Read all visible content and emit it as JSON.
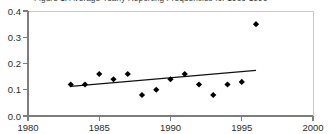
{
  "chart_data": {
    "type": "scatter",
    "title": "Figure 1: Average Yearly Reporting Frequencies for 1983-1996",
    "xlabel": "",
    "ylabel": "",
    "xlim": [
      1980,
      2000
    ],
    "ylim": [
      0.0,
      0.4
    ],
    "xticks": [
      1980,
      1985,
      1990,
      1995,
      2000
    ],
    "xtick_labels": [
      "1980",
      "1985",
      "1990",
      "1995",
      "2000"
    ],
    "yticks": [
      0.0,
      0.1,
      0.2,
      0.3,
      0.4
    ],
    "ytick_labels": [
      "0.0",
      "0.1",
      "0.2",
      "0.3",
      "0.4"
    ],
    "grid": false,
    "legend": false,
    "legend_position": "none",
    "x": [
      1983,
      1984,
      1985,
      1986,
      1987,
      1988,
      1989,
      1990,
      1991,
      1992,
      1993,
      1994,
      1995,
      1996
    ],
    "values": [
      0.12,
      0.12,
      0.16,
      0.14,
      0.16,
      0.08,
      0.1,
      0.14,
      0.16,
      0.12,
      0.08,
      0.12,
      0.13,
      0.35
    ],
    "series": [
      {
        "name": "Average yearly reporting frequency",
        "x": [
          1983,
          1984,
          1985,
          1986,
          1987,
          1988,
          1989,
          1990,
          1991,
          1992,
          1993,
          1994,
          1995,
          1996
        ],
        "values": [
          0.12,
          0.12,
          0.16,
          0.14,
          0.16,
          0.08,
          0.1,
          0.14,
          0.16,
          0.12,
          0.08,
          0.12,
          0.13,
          0.35
        ],
        "marker": "diamond",
        "color": "#000000"
      }
    ],
    "trend_line": {
      "name": "Linear trend",
      "x": [
        1983,
        1996
      ],
      "values": [
        0.113,
        0.174
      ],
      "color": "#111111"
    },
    "colors": {
      "marker": "#000000",
      "trend": "#111111",
      "axis": "#7d7d7d",
      "frame": "#c9c9c9",
      "text": "#2b2b2b",
      "background": "#ffffff"
    }
  }
}
